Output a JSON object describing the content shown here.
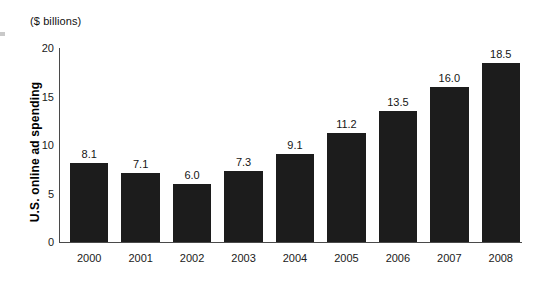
{
  "figure": {
    "units_caption": "($ billions)",
    "y_axis_title": "U.S. online ad spending",
    "bar_color": "#1c1c1c",
    "axis_color": "#4a4a4a",
    "background": "#ffffff"
  },
  "chart_data": {
    "type": "bar",
    "title": "",
    "subtitle": "",
    "xlabel": "",
    "ylabel": "U.S. online ad spending",
    "units": "($ billions)",
    "categories": [
      "2000",
      "2001",
      "2002",
      "2003",
      "2004",
      "2005",
      "2006",
      "2007",
      "2008"
    ],
    "values": [
      8.1,
      7.1,
      6.0,
      7.3,
      9.1,
      11.2,
      13.5,
      16.0,
      18.5
    ],
    "value_labels": [
      "8.1",
      "7.1",
      "6.0",
      "7.3",
      "9.1",
      "11.2",
      "13.5",
      "16.0",
      "18.5"
    ],
    "ylim": [
      0,
      20
    ],
    "yticks": [
      0,
      5,
      10,
      15,
      20
    ],
    "ytick_labels": [
      "0",
      "5",
      "10",
      "15",
      "20"
    ],
    "grid": false,
    "legend": null,
    "series": [
      {
        "name": "U.S. online ad spending",
        "values": [
          8.1,
          7.1,
          6.0,
          7.3,
          9.1,
          11.2,
          13.5,
          16.0,
          18.5
        ]
      }
    ]
  }
}
